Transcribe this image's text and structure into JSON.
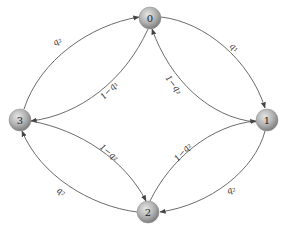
{
  "diagram": {
    "type": "markov-chain",
    "nodes": [
      {
        "id": "0",
        "label": "0",
        "x": 150,
        "y": 18
      },
      {
        "id": "1",
        "label": "1",
        "x": 267,
        "y": 120
      },
      {
        "id": "2",
        "label": "2",
        "x": 148,
        "y": 212
      },
      {
        "id": "3",
        "label": "3",
        "x": 20,
        "y": 120
      }
    ],
    "edges": [
      {
        "from": "3",
        "to": "0",
        "label": "q₂",
        "kind": "outer"
      },
      {
        "from": "0",
        "to": "1",
        "label": "q₁",
        "kind": "outer"
      },
      {
        "from": "1",
        "to": "0",
        "label": "1−q₂",
        "kind": "inner"
      },
      {
        "from": "0",
        "to": "3",
        "label": "1−q₁",
        "kind": "inner"
      },
      {
        "from": "3",
        "to": "2",
        "label": "1−q₂",
        "kind": "inner"
      },
      {
        "from": "2",
        "to": "1",
        "label": "1−q₂",
        "kind": "inner"
      },
      {
        "from": "1",
        "to": "2",
        "label": "q₂",
        "kind": "outer"
      },
      {
        "from": "2",
        "to": "3",
        "label": "q₂",
        "kind": "outer"
      }
    ]
  },
  "colors": {
    "node_fill_light": "#d6d6d6",
    "node_fill_dark": "#8c8c8c",
    "edge": "#5a5a5a"
  }
}
